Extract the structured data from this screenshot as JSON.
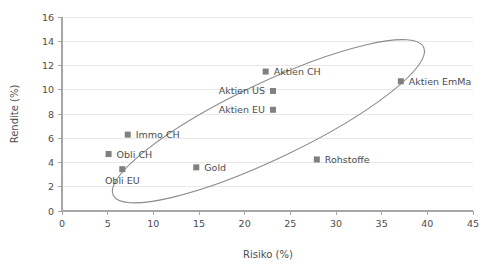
{
  "chart_data": {
    "type": "scatter",
    "title": "",
    "xlabel": "Risiko (%)",
    "ylabel": "Rendite (%)",
    "xlim": [
      0,
      45
    ],
    "ylim": [
      0,
      16
    ],
    "xticks": [
      0,
      5,
      10,
      15,
      20,
      25,
      30,
      35,
      40,
      45
    ],
    "yticks": [
      0,
      2,
      4,
      6,
      8,
      10,
      12,
      14,
      16
    ],
    "grid": "horizontal",
    "legend": "none",
    "marker_color": "#808080",
    "grid_color": "#e9e9e9",
    "axis_color": "#a6a6a6",
    "text_color": "#4d4d4d",
    "ellipse_color": "#8c8c8c",
    "annotation": {
      "shape": "ellipse",
      "description": "Rotated ellipse enclosing the efficient frontier cloud",
      "center_x": 22.6,
      "center_y": 7.4,
      "rotation_deg": -25.5
    },
    "points": [
      {
        "label": "Obli EU",
        "x": 6.6,
        "y": 3.45,
        "label_pos": "below"
      },
      {
        "label": "Obli CH",
        "x": 5.1,
        "y": 4.7,
        "label_pos": "right"
      },
      {
        "label": "Immo CH",
        "x": 7.2,
        "y": 6.3,
        "label_pos": "right"
      },
      {
        "label": "Gold",
        "x": 14.7,
        "y": 3.6,
        "label_pos": "right"
      },
      {
        "label": "Rohstoffe",
        "x": 27.9,
        "y": 4.25,
        "label_pos": "right"
      },
      {
        "label": "Aktien EU",
        "x": 23.1,
        "y": 8.35,
        "label_pos": "left"
      },
      {
        "label": "Aktien US",
        "x": 23.1,
        "y": 9.9,
        "label_pos": "left"
      },
      {
        "label": "Aktien CH",
        "x": 22.3,
        "y": 11.5,
        "label_pos": "right"
      },
      {
        "label": "Aktien EmMa",
        "x": 37.1,
        "y": 10.7,
        "label_pos": "right"
      }
    ]
  }
}
